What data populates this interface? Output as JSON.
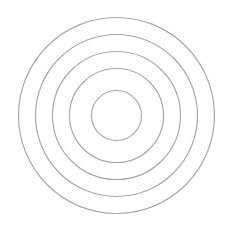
{
  "diagram": {
    "type": "concentric-circles",
    "background": "#ffffff",
    "stroke_color": "#a9a9a9",
    "stroke_width": 1.2,
    "center": {
      "x": 116.5,
      "y": 115.5
    },
    "circles": [
      {
        "r": 25
      },
      {
        "r": 47
      },
      {
        "r": 64
      },
      {
        "r": 81
      },
      {
        "r": 98
      }
    ]
  }
}
